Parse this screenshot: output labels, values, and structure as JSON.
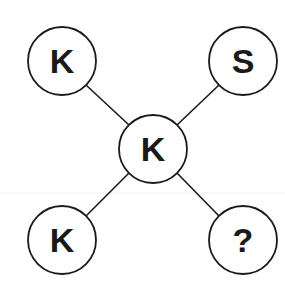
{
  "puzzle": {
    "center": {
      "label": "K",
      "cx": 153,
      "cy": 149
    },
    "nodes": [
      {
        "position": "top-left",
        "label": "K",
        "cx": 62,
        "cy": 61
      },
      {
        "position": "top-right",
        "label": "S",
        "cx": 243,
        "cy": 61
      },
      {
        "position": "bottom-left",
        "label": "K",
        "cx": 62,
        "cy": 240
      },
      {
        "position": "bottom-right",
        "label": "?",
        "cx": 243,
        "cy": 240
      }
    ],
    "radius": 34,
    "stroke_color": "#1a1a1a"
  }
}
